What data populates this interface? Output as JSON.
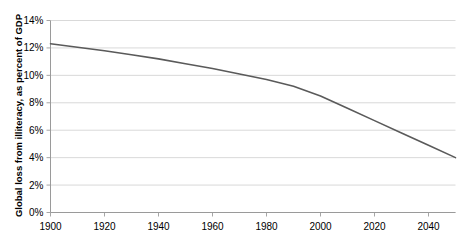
{
  "chart_data": {
    "type": "line",
    "title": "",
    "subtitle": "",
    "xlabel": "",
    "ylabel": "Global loss from illiteracy, as percent of GDP",
    "xlim": [
      1900,
      2050
    ],
    "ylim": [
      0,
      14
    ],
    "grid": true,
    "legend": false,
    "legend_position": "none",
    "y_tick_labels": [
      "0%",
      "2%",
      "4%",
      "6%",
      "8%",
      "10%",
      "12%",
      "14%"
    ],
    "y_tick_values": [
      0,
      2,
      4,
      6,
      8,
      10,
      12,
      14
    ],
    "x_tick_labels": [
      "1900",
      "1920",
      "1940",
      "1960",
      "1980",
      "2000",
      "2020",
      "2040"
    ],
    "x_tick_values": [
      1900,
      1920,
      1940,
      1960,
      1980,
      2000,
      2020,
      2040
    ],
    "line_color": "#5a5a5a",
    "grid_color": "#d9d9d9",
    "axis_color": "#a6a6a6",
    "series": [
      {
        "name": "Global loss from illiteracy",
        "x": [
          1900,
          1910,
          1920,
          1930,
          1940,
          1950,
          1960,
          1970,
          1980,
          1990,
          2000,
          2010,
          2020,
          2030,
          2040,
          2050
        ],
        "values": [
          12.3,
          12.05,
          11.8,
          11.5,
          11.2,
          10.85,
          10.5,
          10.1,
          9.7,
          9.2,
          8.5,
          7.6,
          6.7,
          5.8,
          4.9,
          4.0
        ]
      }
    ]
  },
  "axis_titles": {
    "y": "Global loss from illiteracy, as percent of GDP"
  }
}
